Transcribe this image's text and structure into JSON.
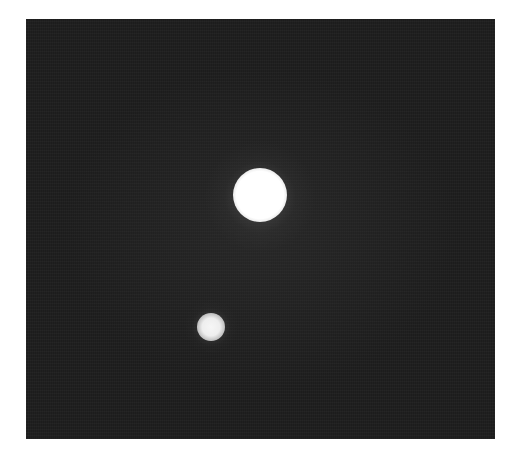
{
  "image": {
    "description": "Grayscale photograph of two bright circular spots on a dark noisy background",
    "background_color": "#1c1c1c",
    "page_color": "#ffffff",
    "frame": {
      "x": 26,
      "y": 19,
      "width": 469,
      "height": 420
    },
    "spots": [
      {
        "label": "large-spot",
        "cx": 260,
        "cy": 195,
        "r": 26,
        "color": "#ffffff"
      },
      {
        "label": "small-spot",
        "cx": 211,
        "cy": 327,
        "r": 13,
        "color": "#f2f2f2"
      }
    ]
  }
}
